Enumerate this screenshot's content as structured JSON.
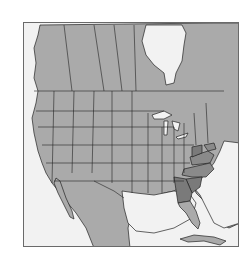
{
  "map": {
    "title": "",
    "region": "North America",
    "colors": {
      "background": "#f2f2f2",
      "land": "#aaaaaa",
      "highlight": "#8a8a8a",
      "highlight_dark": "#7a7a7a",
      "border": "#222222",
      "frame": "#6a6a6a"
    },
    "highlighted_regions": [
      "Georgia",
      "South Carolina",
      "North Carolina",
      "Virginia",
      "West Virginia",
      "Maryland",
      "Delaware"
    ],
    "visible_regions": [
      "Canada",
      "United States",
      "Mexico",
      "Cuba",
      "Bahamas",
      "Hudson Bay",
      "Great Lakes",
      "Gulf of Mexico"
    ]
  }
}
